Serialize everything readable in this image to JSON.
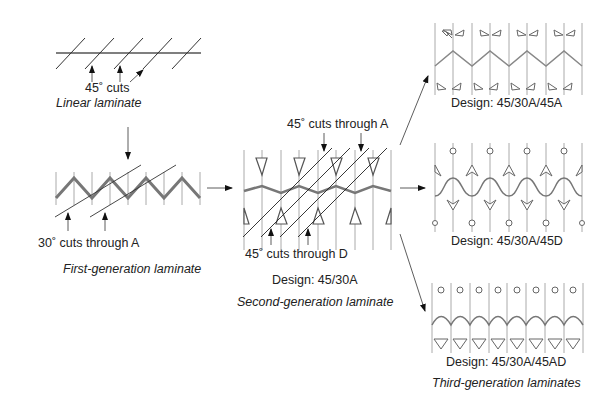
{
  "figure": {
    "linear": {
      "cuts_label": "45˚ cuts",
      "caption": "Linear laminate"
    },
    "first_generation": {
      "cuts_label": "30˚ cuts through A",
      "caption": "First-generation laminate"
    },
    "second_generation": {
      "top_cuts_label": "45˚ cuts through A",
      "bottom_cuts_label": "45˚ cuts through D",
      "design": "Design: 45/30A",
      "caption": "Second-generation laminate"
    },
    "third_generation": {
      "designs": [
        "Design: 45/30A/45A",
        "Design: 45/30A/45D",
        "Design: 45/30A/45AD"
      ],
      "caption": "Third-generation laminates"
    }
  },
  "colors": {
    "ink": "#222222",
    "laminate_thick": "#777777",
    "grid": "#999999"
  }
}
